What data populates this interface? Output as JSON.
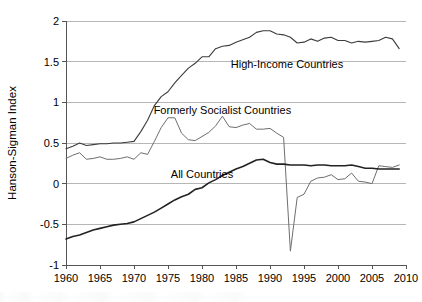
{
  "chart_data": {
    "type": "line",
    "title": "",
    "subtitle": "",
    "xlabel": "",
    "ylabel": "Hanson-Sigman Index",
    "xlim": [
      1960,
      2010
    ],
    "ylim": [
      -1,
      2
    ],
    "grid": "horizontal",
    "legend_position": "inline-annotations",
    "xticks": [
      1960,
      1965,
      1970,
      1975,
      1980,
      1985,
      1990,
      1995,
      2000,
      2005,
      2010
    ],
    "xtick_labels": [
      "1960",
      "1965",
      "1970",
      "1975",
      "1980",
      "1985",
      "1990",
      "1995",
      "2000",
      "2005",
      "2010"
    ],
    "yticks": [
      -1,
      -0.5,
      0,
      0.5,
      1,
      1.5,
      2
    ],
    "ytick_labels": [
      "-1",
      "-0.5",
      "0",
      "0.5",
      "1",
      "1.5",
      "2"
    ],
    "x": [
      1960,
      1961,
      1962,
      1963,
      1964,
      1965,
      1966,
      1967,
      1968,
      1969,
      1970,
      1971,
      1972,
      1973,
      1974,
      1975,
      1976,
      1977,
      1978,
      1979,
      1980,
      1981,
      1982,
      1983,
      1984,
      1985,
      1986,
      1987,
      1988,
      1989,
      1990,
      1991,
      1992,
      1993,
      1994,
      1995,
      1996,
      1997,
      1998,
      1999,
      2000,
      2001,
      2002,
      2003,
      2004,
      2005,
      2006,
      2007,
      2008,
      2009
    ],
    "series": [
      {
        "name": "High-Income Countries",
        "color": "#3c3c3c",
        "width": 1.1,
        "label_x": 1992.5,
        "label_y": 1.47,
        "values": [
          0.43,
          0.46,
          0.5,
          0.47,
          0.48,
          0.49,
          0.49,
          0.5,
          0.5,
          0.51,
          0.52,
          0.64,
          0.78,
          0.96,
          1.07,
          1.13,
          1.24,
          1.33,
          1.42,
          1.48,
          1.56,
          1.56,
          1.66,
          1.69,
          1.7,
          1.74,
          1.77,
          1.8,
          1.86,
          1.88,
          1.88,
          1.84,
          1.83,
          1.8,
          1.73,
          1.74,
          1.78,
          1.75,
          1.79,
          1.8,
          1.76,
          1.76,
          1.73,
          1.75,
          1.74,
          1.75,
          1.76,
          1.8,
          1.78,
          1.66
        ]
      },
      {
        "name": "Formerly Socialist Countries",
        "color": "#6e6e6e",
        "width": 1.0,
        "label_x": 1983.0,
        "label_y": 0.9,
        "values": [
          0.31,
          0.35,
          0.38,
          0.3,
          0.31,
          0.33,
          0.3,
          0.3,
          0.31,
          0.33,
          0.3,
          0.38,
          0.36,
          0.52,
          0.69,
          0.81,
          0.81,
          0.62,
          0.54,
          0.53,
          0.58,
          0.63,
          0.71,
          0.83,
          0.7,
          0.69,
          0.72,
          0.74,
          0.67,
          0.67,
          0.68,
          0.62,
          0.57,
          -0.83,
          -0.17,
          -0.13,
          0.03,
          0.07,
          0.08,
          0.11,
          0.05,
          0.06,
          0.13,
          0.03,
          0.02,
          0.0,
          0.22,
          0.21,
          0.2,
          0.23
        ]
      },
      {
        "name": "All Countries",
        "color": "#222222",
        "width": 1.6,
        "label_x": 1980.0,
        "label_y": 0.12,
        "values": [
          -0.68,
          -0.65,
          -0.63,
          -0.6,
          -0.57,
          -0.55,
          -0.53,
          -0.51,
          -0.5,
          -0.49,
          -0.47,
          -0.43,
          -0.39,
          -0.35,
          -0.3,
          -0.25,
          -0.2,
          -0.16,
          -0.13,
          -0.07,
          -0.05,
          0.01,
          0.05,
          0.1,
          0.14,
          0.18,
          0.21,
          0.25,
          0.29,
          0.3,
          0.26,
          0.24,
          0.24,
          0.23,
          0.23,
          0.23,
          0.22,
          0.23,
          0.23,
          0.22,
          0.22,
          0.22,
          0.23,
          0.21,
          0.19,
          0.19,
          0.18,
          0.18,
          0.18,
          0.18
        ]
      }
    ],
    "series_extra_notes": {
      "formerly_socialist_dip_year": 1991,
      "formerly_socialist_dip_value": -0.83
    }
  },
  "annotations": [
    {
      "id": "high-income",
      "text": "High-Income Countries"
    },
    {
      "id": "formerly-socialist",
      "text": "Formerly Socialist Countries"
    },
    {
      "id": "all-countries",
      "text": "All Countries"
    }
  ],
  "axis": {
    "y_title": "Hanson-Sigman Index"
  }
}
